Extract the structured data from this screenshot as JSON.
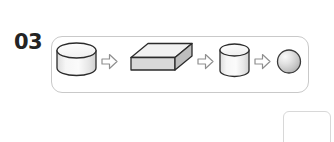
{
  "diagram": {
    "step_number": "03",
    "type": "process-flow",
    "orientation": "horizontal",
    "panel": {
      "border_color": "#c9c9c9",
      "background": "#ffffff",
      "corner_radius": 11
    },
    "nodes": [
      {
        "id": "node-1",
        "shape": "cylinder",
        "variant": "wide-flat-disk",
        "label": "",
        "fill": "#f2f2f2",
        "top_face_fill": "#fbfbfb",
        "stroke": "#2b2b2b"
      },
      {
        "id": "node-2",
        "shape": "box",
        "variant": "isometric-slab",
        "label": "",
        "top_face_fill": "#f0f0f0",
        "front_face_fill": "#d9d9d9",
        "side_face_fill": "#bfbfbf",
        "stroke": "#2b2b2b"
      },
      {
        "id": "node-3",
        "shape": "cylinder",
        "variant": "narrow-tall",
        "label": "",
        "fill": "#f2f2f2",
        "top_face_fill": "#fbfbfb",
        "stroke": "#2b2b2b"
      },
      {
        "id": "node-4",
        "shape": "sphere",
        "variant": "shaded-ball",
        "label": "",
        "fill": "#d0d0d0",
        "highlight": "#f4f4f4",
        "stroke": "#3a3a3a"
      }
    ],
    "connectors": [
      {
        "id": "arrow-1",
        "type": "block-arrow",
        "direction": "right",
        "from": "node-1",
        "to": "node-2",
        "fill": "#ffffff",
        "stroke": "#8a8a8a"
      },
      {
        "id": "arrow-2",
        "type": "block-arrow",
        "direction": "right",
        "from": "node-2",
        "to": "node-3",
        "fill": "#ffffff",
        "stroke": "#8a8a8a"
      },
      {
        "id": "arrow-3",
        "type": "block-arrow",
        "direction": "right",
        "from": "node-3",
        "to": "node-4",
        "fill": "#ffffff",
        "stroke": "#8a8a8a"
      }
    ],
    "ghost_placeholder": {
      "id": "empty-box",
      "label": "",
      "border_color": "#d8d8d8",
      "background": "#ffffff"
    }
  }
}
